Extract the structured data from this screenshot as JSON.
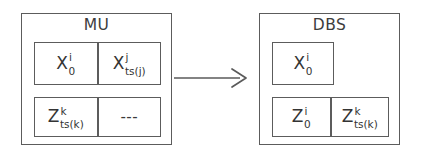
{
  "diagram": {
    "type": "block-diagram",
    "colors": {
      "stroke": "#5c5c5c",
      "text": "#3a3a3a",
      "background": "#ffffff"
    },
    "groups": [
      {
        "id": "mu",
        "title": "MU",
        "rows": [
          {
            "id": "mu-row-1",
            "cells": [
              {
                "base": "X",
                "sup": "i",
                "sub": "0"
              },
              {
                "base": "X",
                "sup": "j",
                "sub": "ts(j)"
              }
            ]
          },
          {
            "id": "mu-row-2",
            "cells": [
              {
                "base": "Z",
                "sup": "k",
                "sub": "ts(k)"
              },
              {
                "base": "---",
                "sup": "",
                "sub": ""
              }
            ]
          }
        ]
      },
      {
        "id": "dbs",
        "title": "DBS",
        "rows": [
          {
            "id": "dbs-row-1",
            "cells": [
              {
                "base": "X",
                "sup": "i",
                "sub": "0"
              }
            ]
          },
          {
            "id": "dbs-row-2",
            "cells": [
              {
                "base": "Z",
                "sup": "i",
                "sub": "0"
              },
              {
                "base": "Z",
                "sup": "k",
                "sub": "ts(k)"
              }
            ]
          }
        ]
      }
    ],
    "arrow": {
      "name": "arrow-right-icon",
      "direction": "right",
      "from": "mu",
      "to": "dbs",
      "label": ""
    }
  }
}
